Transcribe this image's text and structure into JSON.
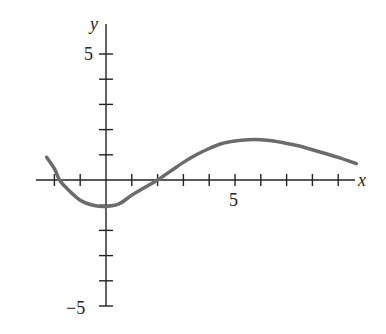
{
  "chart_data": {
    "type": "line",
    "title": "",
    "xlabel": "x",
    "ylabel": "y",
    "xlim": [
      -2.5,
      9.8
    ],
    "ylim": [
      -5.5,
      5.8
    ],
    "x_tick_labels": [
      "5"
    ],
    "y_tick_labels": [
      "5",
      "-5"
    ],
    "x_ticks": [
      -2,
      -1,
      1,
      2,
      3,
      4,
      5,
      6,
      7,
      8,
      9
    ],
    "y_ticks": [
      -5,
      -4,
      -3,
      -2,
      -1,
      1,
      2,
      3,
      4,
      5
    ],
    "grid": false,
    "series": [
      {
        "name": "f(x)",
        "x": [
          -2.3,
          -2.0,
          -1.8,
          -1.5,
          -1.0,
          -0.5,
          0,
          0.5,
          1.0,
          1.5,
          2.0,
          2.5,
          3,
          3.5,
          4,
          4.5,
          5,
          5.5,
          6,
          6.5,
          7,
          7.5,
          8,
          8.5,
          9,
          9.7
        ],
        "y": [
          0.9,
          0.45,
          0.0,
          -0.35,
          -0.8,
          -1.0,
          -1.05,
          -0.95,
          -0.6,
          -0.3,
          0.0,
          0.35,
          0.7,
          1.0,
          1.25,
          1.45,
          1.55,
          1.6,
          1.6,
          1.55,
          1.45,
          1.35,
          1.2,
          1.05,
          0.9,
          0.65
        ]
      }
    ]
  },
  "labels": {
    "x": "x",
    "y": "y",
    "x5": "5",
    "y5": "5",
    "yneg5": "−5"
  }
}
